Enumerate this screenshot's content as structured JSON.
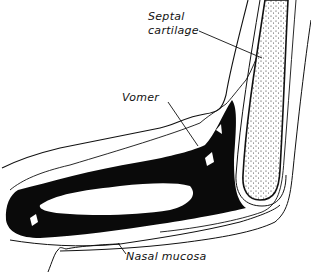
{
  "diagram": {
    "type": "anatomical line drawing",
    "colors": {
      "ink": "#111111",
      "background": "#ffffff"
    },
    "labels": [
      {
        "id": "septal",
        "line1": "Septal",
        "line2": "cartilage"
      },
      {
        "id": "vomer",
        "text": "Vomer"
      },
      {
        "id": "mucosa",
        "text": "Nasal mucosa"
      }
    ]
  }
}
